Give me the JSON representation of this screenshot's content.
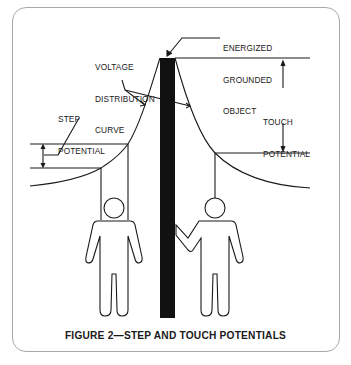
{
  "figure": {
    "caption": "FIGURE 2—STEP AND TOUCH POTENTIALS",
    "labels": {
      "energized_object": [
        "ENERGIZED",
        "GROUNDED",
        "OBJECT"
      ],
      "voltage_curve": [
        "VOLTAGE",
        "DISTRIBUTION",
        "CURVE"
      ],
      "step_potential": [
        "STEP",
        "POTENTIAL"
      ],
      "touch_potential": [
        "TOUCH",
        "POTENTIAL"
      ]
    },
    "elements": {
      "pole": "energized grounded object (black vertical bar)",
      "left_person": "person standing with feet apart (step potential)",
      "right_person": "person touching the pole (touch potential)"
    },
    "colors": {
      "line": "#1a1a1a",
      "pole": "#111111",
      "frame_border": "#a8a8a8"
    }
  }
}
